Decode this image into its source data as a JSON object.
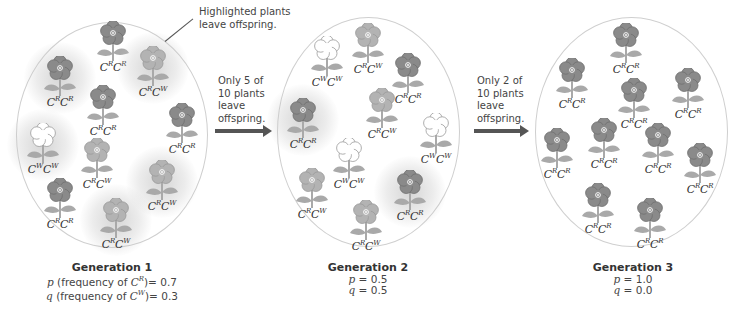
{
  "colors": {
    "red_flower": "#8a8a8a",
    "red_flower_dark": "#6e6e6e",
    "pink_flower": "#b3b3b3",
    "pink_flower_dark": "#999999",
    "white_flower": "#ffffff",
    "white_flower_outline": "#9a9a9a",
    "leaf": "#a9a9a9",
    "arrow": "#555555",
    "ellipse_border": "#cfcfcf"
  },
  "annotations": {
    "highlight_note_line1": "Highlighted plants",
    "highlight_note_line2": "leave offspring.",
    "arrow1_line1": "Only 5 of",
    "arrow1_line2": "10 plants",
    "arrow1_line3": "leave",
    "arrow1_line4": "offspring.",
    "arrow2_line1": "Only 2 of",
    "arrow2_line2": "10 plants",
    "arrow2_line3": "leave",
    "arrow2_line4": "offspring."
  },
  "generations": [
    {
      "title": "Generation 1",
      "p_line": {
        "var": "p",
        "text": " (frequency of ",
        "allele": "C",
        "sup": "R",
        "value": ")= 0.7"
      },
      "q_line": {
        "var": "q",
        "text": " (frequency of ",
        "allele": "C",
        "sup": "W",
        "value": ")= 0.3"
      },
      "plants": [
        {
          "genotype": [
            "R",
            "R"
          ],
          "color": "red",
          "highlighted": false
        },
        {
          "genotype": [
            "R",
            "R"
          ],
          "color": "red",
          "highlighted": true
        },
        {
          "genotype": [
            "R",
            "W"
          ],
          "color": "pink",
          "highlighted": true
        },
        {
          "genotype": [
            "R",
            "R"
          ],
          "color": "red",
          "highlighted": false
        },
        {
          "genotype": [
            "R",
            "R"
          ],
          "color": "red",
          "highlighted": false
        },
        {
          "genotype": [
            "W",
            "W"
          ],
          "color": "white",
          "highlighted": true
        },
        {
          "genotype": [
            "R",
            "W"
          ],
          "color": "pink",
          "highlighted": false
        },
        {
          "genotype": [
            "R",
            "W"
          ],
          "color": "pink",
          "highlighted": true
        },
        {
          "genotype": [
            "R",
            "R"
          ],
          "color": "red",
          "highlighted": false
        },
        {
          "genotype": [
            "R",
            "W"
          ],
          "color": "pink",
          "highlighted": true
        }
      ]
    },
    {
      "title": "Generation 2",
      "p_line": {
        "var": "p",
        "text": " = 0.5"
      },
      "q_line": {
        "var": "q",
        "text": " = 0.5"
      },
      "plants": [
        {
          "genotype": [
            "W",
            "W"
          ],
          "color": "white",
          "highlighted": false
        },
        {
          "genotype": [
            "R",
            "W"
          ],
          "color": "pink",
          "highlighted": false
        },
        {
          "genotype": [
            "R",
            "R"
          ],
          "color": "red",
          "highlighted": false
        },
        {
          "genotype": [
            "R",
            "R"
          ],
          "color": "red",
          "highlighted": true
        },
        {
          "genotype": [
            "R",
            "W"
          ],
          "color": "pink",
          "highlighted": false
        },
        {
          "genotype": [
            "W",
            "W"
          ],
          "color": "white",
          "highlighted": false
        },
        {
          "genotype": [
            "W",
            "W"
          ],
          "color": "white",
          "highlighted": false
        },
        {
          "genotype": [
            "R",
            "W"
          ],
          "color": "pink",
          "highlighted": false
        },
        {
          "genotype": [
            "R",
            "R"
          ],
          "color": "red",
          "highlighted": true
        },
        {
          "genotype": [
            "R",
            "W"
          ],
          "color": "pink",
          "highlighted": false
        }
      ]
    },
    {
      "title": "Generation 3",
      "p_line": {
        "var": "p",
        "text": " = 1.0"
      },
      "q_line": {
        "var": "q",
        "text": " = 0.0"
      },
      "plants": [
        {
          "genotype": [
            "R",
            "R"
          ],
          "color": "red",
          "highlighted": false
        },
        {
          "genotype": [
            "R",
            "R"
          ],
          "color": "red",
          "highlighted": false
        },
        {
          "genotype": [
            "R",
            "R"
          ],
          "color": "red",
          "highlighted": false
        },
        {
          "genotype": [
            "R",
            "R"
          ],
          "color": "red",
          "highlighted": false
        },
        {
          "genotype": [
            "R",
            "R"
          ],
          "color": "red",
          "highlighted": false
        },
        {
          "genotype": [
            "R",
            "R"
          ],
          "color": "red",
          "highlighted": false
        },
        {
          "genotype": [
            "R",
            "R"
          ],
          "color": "red",
          "highlighted": false
        },
        {
          "genotype": [
            "R",
            "R"
          ],
          "color": "red",
          "highlighted": false
        },
        {
          "genotype": [
            "R",
            "R"
          ],
          "color": "red",
          "highlighted": false
        },
        {
          "genotype": [
            "R",
            "R"
          ],
          "color": "red",
          "highlighted": false
        }
      ]
    }
  ]
}
